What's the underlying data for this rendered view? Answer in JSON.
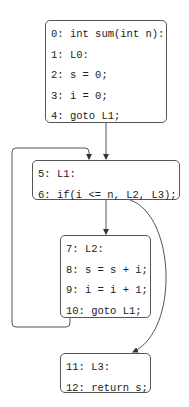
{
  "diagram": {
    "type": "control-flow-graph",
    "blocks": [
      {
        "id": "B0",
        "lines": [
          "0: int sum(int n):",
          "1: L0:",
          "2: s = 0;",
          "3: i = 0;",
          "4: goto L1;"
        ]
      },
      {
        "id": "B1",
        "lines": [
          "5: L1:",
          "6: if(i <= n, L2, L3);"
        ]
      },
      {
        "id": "B2",
        "lines": [
          "7: L2:",
          "8: s = s + i;",
          "9: i = i + 1;",
          "10: goto L1;"
        ]
      },
      {
        "id": "B3",
        "lines": [
          "11: L3:",
          "12: return s;"
        ]
      }
    ],
    "edges": [
      {
        "from": "B0",
        "to": "B1",
        "style": "straight"
      },
      {
        "from": "B1",
        "to": "B2",
        "style": "straight"
      },
      {
        "from": "B1",
        "to": "B3",
        "style": "curved"
      },
      {
        "from": "B2",
        "to": "B1",
        "style": "back-edge-loop"
      }
    ],
    "colors": {
      "line": "#555555",
      "text": "#222222",
      "background": "#ffffff"
    }
  }
}
